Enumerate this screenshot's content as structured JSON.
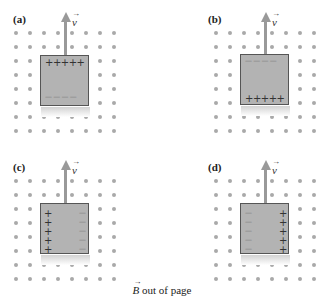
{
  "figure": {
    "caption": {
      "symbol": "B",
      "vector_mark": "→",
      "text": " out of page"
    },
    "velocity": {
      "symbol": "v",
      "vector_mark": "→"
    },
    "colors": {
      "dot": "#a9a9a9",
      "box_fill": "#b3b3b3",
      "box_border": "#555555",
      "arrow": "#999999"
    },
    "panels": [
      {
        "id": "a",
        "label": "(a)",
        "charge_layout": "top-plus-bottom-minus",
        "top": "+++++",
        "bottom": "— — — —"
      },
      {
        "id": "b",
        "label": "(b)",
        "charge_layout": "top-minus-bottom-plus",
        "top": "— — — —",
        "bottom": "+++++"
      },
      {
        "id": "c",
        "label": "(c)",
        "charge_layout": "left-plus-right-minus",
        "left": [
          "+",
          "+",
          "+",
          "+",
          "+"
        ],
        "right": [
          "—",
          "—",
          "—",
          "—",
          "—"
        ]
      },
      {
        "id": "d",
        "label": "(d)",
        "charge_layout": "left-minus-right-plus",
        "left": [
          "—",
          "—",
          "—",
          "—",
          "—"
        ],
        "right": [
          "+",
          "+",
          "+",
          "+",
          "+"
        ]
      }
    ]
  }
}
